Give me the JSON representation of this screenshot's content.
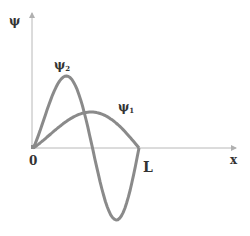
{
  "chart_data": {
    "type": "line",
    "title": "",
    "xlabel": "x",
    "ylabel": "ψ",
    "origin_label": "0",
    "x_end_label": "L",
    "grid": false,
    "x": [
      0,
      0.125,
      0.25,
      0.375,
      0.5,
      0.625,
      0.75,
      0.875,
      1.0
    ],
    "series": [
      {
        "name": "ψ1",
        "label": "ψ",
        "subscript": "1",
        "description": "half sine wave, n=1",
        "values": [
          0,
          0.38,
          0.71,
          0.92,
          1.0,
          0.92,
          0.71,
          0.38,
          0
        ]
      },
      {
        "name": "ψ2",
        "label": "ψ",
        "subscript": "2",
        "description": "full sine wave, n=2",
        "values": [
          0,
          1.0,
          1.41,
          1.0,
          0,
          -1.0,
          -1.41,
          -1.0,
          0
        ]
      }
    ]
  },
  "labels": {
    "y_axis": "ψ",
    "x_axis": "x",
    "origin": "0",
    "end": "L",
    "psi1_main": "ψ",
    "psi1_sub": "1",
    "psi2_main": "ψ",
    "psi2_sub": "2"
  },
  "colors": {
    "curve": "#8a8a8a",
    "axis": "#b0b0b0",
    "text": "#333333"
  }
}
